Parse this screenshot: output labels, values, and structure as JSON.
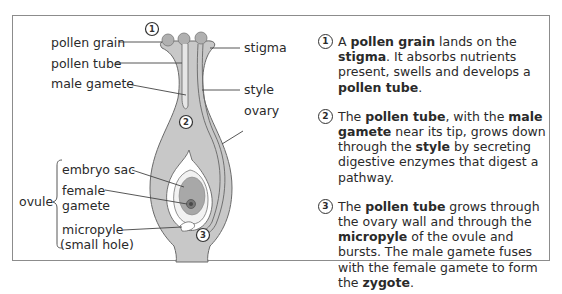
{
  "diagram": {
    "labels": {
      "pollen_grain": "pollen grain",
      "pollen_tube": "pollen tube",
      "male_gamete": "male gamete",
      "stigma": "stigma",
      "style": "style",
      "ovary": "ovary",
      "ovule": "ovule",
      "embryo_sac": "embryo sac",
      "female": "female",
      "gamete": "gamete",
      "micropyle": "micropyle",
      "small_hole": "(small hole)"
    },
    "markers": [
      "1",
      "2",
      "3"
    ],
    "colors": {
      "tissue": "#c8c8c8",
      "embryo_sac": "#a8a8a8",
      "outline": "#555555",
      "frame": "#8c8c8c"
    }
  },
  "steps": [
    {
      "number": "1",
      "parts": [
        {
          "t": "A ",
          "b": false
        },
        {
          "t": "pollen grain",
          "b": true
        },
        {
          "t": " lands on the ",
          "b": false
        },
        {
          "t": "stigma",
          "b": true
        },
        {
          "t": ". It absorbs nutrients present, swells and develops a ",
          "b": false
        },
        {
          "t": "pollen tube",
          "b": true
        },
        {
          "t": ".",
          "b": false
        }
      ]
    },
    {
      "number": "2",
      "parts": [
        {
          "t": "The ",
          "b": false
        },
        {
          "t": "pollen tube",
          "b": true
        },
        {
          "t": ", with the ",
          "b": false
        },
        {
          "t": "male gamete",
          "b": true
        },
        {
          "t": " near its tip, grows down through the ",
          "b": false
        },
        {
          "t": "style",
          "b": true
        },
        {
          "t": " by secreting digestive enzymes that digest a pathway.",
          "b": false
        }
      ]
    },
    {
      "number": "3",
      "parts": [
        {
          "t": "The ",
          "b": false
        },
        {
          "t": "pollen tube",
          "b": true
        },
        {
          "t": " grows through the ovary wall  and through the ",
          "b": false
        },
        {
          "t": "micropyle",
          "b": true
        },
        {
          "t": " of the ovule and bursts. The male gamete fuses with the female gamete to form the ",
          "b": false
        },
        {
          "t": "zygote",
          "b": true
        },
        {
          "t": ".",
          "b": false
        }
      ]
    }
  ]
}
